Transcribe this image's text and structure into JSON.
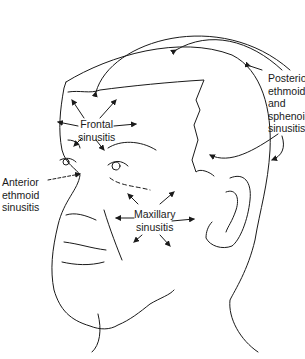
{
  "diagram": {
    "line_color": "#1a1a1a",
    "background": "#ffffff",
    "labels": {
      "frontal": [
        "Frontal",
        "sinusitis"
      ],
      "anterior": [
        "Anterior",
        "ethmoid",
        "sinusitis"
      ],
      "maxillary": [
        "Maxillary",
        "sinusitis"
      ],
      "posterior": [
        "Posterior",
        "ethmoid",
        "and",
        "sphenoid",
        "sinusitis"
      ]
    }
  }
}
